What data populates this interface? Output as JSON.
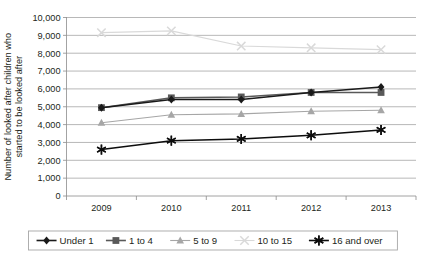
{
  "chart_data": {
    "type": "line",
    "title": "",
    "xlabel": "",
    "ylabel": "Number of looked after children who started to be looked after",
    "categories": [
      "2009",
      "2010",
      "2011",
      "2012",
      "2013"
    ],
    "ylim": [
      0,
      10000
    ],
    "ytick_step": 1000,
    "ytick_labels": [
      "0",
      "1,000",
      "2,000",
      "3,000",
      "4,000",
      "5,000",
      "6,000",
      "7,000",
      "8,000",
      "9,000",
      "10,000"
    ],
    "grid": true,
    "legend_position": "bottom",
    "series": [
      {
        "name": "Under 1",
        "marker": "diamond",
        "color": "#1a1a1a",
        "values": [
          4950,
          5400,
          5400,
          5800,
          6100
        ]
      },
      {
        "name": "1 to 4",
        "marker": "square",
        "color": "#595959",
        "values": [
          4950,
          5500,
          5550,
          5800,
          5800
        ]
      },
      {
        "name": "5 to 9",
        "marker": "triangle",
        "color": "#a6a6a6",
        "values": [
          4100,
          4550,
          4600,
          4750,
          4800
        ]
      },
      {
        "name": "10 to 15",
        "marker": "cross",
        "color": "#d9d9d9",
        "values": [
          9150,
          9250,
          8400,
          8300,
          8200
        ]
      },
      {
        "name": "16 and over",
        "marker": "asterisk",
        "color": "#0d0d0d",
        "values": [
          2600,
          3100,
          3200,
          3400,
          3700
        ]
      }
    ]
  },
  "axis": {
    "y_title": "Number of looked after children who started to be looked after"
  },
  "legend": {
    "items": [
      {
        "label": "Under 1"
      },
      {
        "label": "1 to 4"
      },
      {
        "label": "5 to 9"
      },
      {
        "label": "10 to 15"
      },
      {
        "label": "16 and over"
      }
    ]
  }
}
